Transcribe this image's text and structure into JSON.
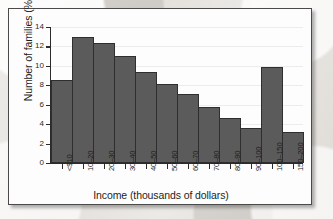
{
  "chart_data": {
    "type": "bar",
    "title": "",
    "xlabel": "Income (thousands of dollars)",
    "ylabel": "Number of families (%)",
    "categories": [
      "<$10",
      "10–20",
      "20–30",
      "30–40",
      "40–50",
      "50–60",
      "60–70",
      "70–80",
      "80–90",
      "90–100",
      "100–150",
      "150–200"
    ],
    "values": [
      8.5,
      13.0,
      12.4,
      11.0,
      9.4,
      8.1,
      7.1,
      5.75,
      4.65,
      3.6,
      9.85,
      3.2
    ],
    "ylim": [
      0,
      14
    ],
    "xlim_categories": 12,
    "y_ticks": [
      0,
      2,
      4,
      6,
      8,
      10,
      12,
      14
    ],
    "y_tick_labels": [
      "0",
      "2",
      "4",
      "6",
      "8",
      "10",
      "12",
      "14"
    ],
    "grid": true,
    "grid_axis": "y",
    "legend": "none",
    "bar_color": "#5b5b5b",
    "bar_edge_color": "#2e2e2e",
    "axis_color": "#2b2b2b",
    "gridline_color": "#ececed",
    "panel_background": "#fdfdfd",
    "panel_border_color": "#4a4a4a",
    "page_background": "#e8e6e2",
    "x_tick_label_rotation": -90,
    "bars_contiguous": true
  }
}
